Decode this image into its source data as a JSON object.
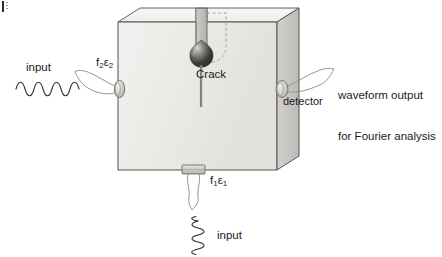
{
  "figure": {
    "background_color": "#ffffff"
  },
  "labels": {
    "input_left": "input",
    "input_bottom": "input",
    "crack": "Crack",
    "detector": "detector",
    "waveform_line1": "waveform output",
    "waveform_line2": "for Fourier analysis",
    "transducer_left_f": "f",
    "transducer_left_f_sub": "2",
    "transducer_left_eps": "ε",
    "transducer_left_eps_sub": "2",
    "transducer_bottom_f": "f",
    "transducer_bottom_f_sub": "1",
    "transducer_bottom_eps": "ε",
    "transducer_bottom_eps_sub": "1"
  },
  "colors": {
    "outline": "#4a4a4a",
    "front_face": "#eceae7",
    "top_face": "#f4f3f1",
    "right_face": "#c9c7c4",
    "notch_wall": "#b9b7b4",
    "crack_line": "#8a8a8a",
    "crack_tip_dark": "#2f2f2f",
    "wave_stroke": "#3a3a3a",
    "leader_stroke": "#8c8c8c",
    "text": "#1a1a1a"
  },
  "geometry": {
    "block_front_left_x": 118,
    "block_front_right_x": 277,
    "block_front_top_y": 22,
    "block_front_bottom_y": 170,
    "depth_dx": 22,
    "depth_dy": -14,
    "notch_left_x": 196,
    "notch_right_x": 207,
    "crack_tip_y": 58,
    "crack_line_bottom_y": 107
  },
  "waveforms": {
    "left_input": {
      "cycles": 5,
      "orientation": "horizontal",
      "amplitude": 9,
      "description": "low frequency sine"
    },
    "bottom_input": {
      "cycles": 9,
      "orientation": "vertical",
      "amplitude": 7,
      "description": "high frequency sine"
    }
  }
}
